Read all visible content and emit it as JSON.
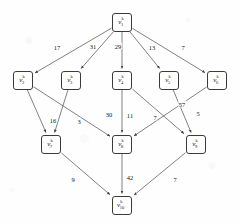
{
  "figure": {
    "background_color": "#fefefe",
    "node_stroke_color": "#3b3b3b",
    "edge_stroke_color": "#4a4a4a",
    "text_color": "#141414"
  },
  "graph": {
    "type": "directed-weighted-graph",
    "node_count": 10,
    "edge_count": 15,
    "layers": [
      [
        "v1"
      ],
      [
        "v2",
        "v3",
        "v4",
        "v5",
        "v6"
      ],
      [
        "v7",
        "v8",
        "v9"
      ],
      [
        "v10"
      ]
    ],
    "nodes": [
      {
        "id": "v1",
        "base": "v",
        "sup": "k",
        "sub": "1",
        "cx": 122,
        "cy": 22,
        "w": 20,
        "h": 19
      },
      {
        "id": "v2",
        "base": "v",
        "sup": "k",
        "sub": "2",
        "cx": 23,
        "cy": 80,
        "w": 20,
        "h": 19
      },
      {
        "id": "v3",
        "base": "v",
        "sup": "k",
        "sub": "3",
        "cx": 71,
        "cy": 80,
        "w": 20,
        "h": 19
      },
      {
        "id": "v4",
        "base": "v",
        "sup": "k",
        "sub": "4",
        "cx": 122,
        "cy": 80,
        "w": 20,
        "h": 19
      },
      {
        "id": "v5",
        "base": "v",
        "sup": "k",
        "sub": "5",
        "cx": 169,
        "cy": 80,
        "w": 20,
        "h": 19
      },
      {
        "id": "v6",
        "base": "v",
        "sup": "k",
        "sub": "6",
        "cx": 217,
        "cy": 80,
        "w": 20,
        "h": 19
      },
      {
        "id": "v7",
        "base": "v",
        "sup": "k",
        "sub": "7",
        "cx": 51,
        "cy": 144,
        "w": 20,
        "h": 19
      },
      {
        "id": "v8",
        "base": "v",
        "sup": "k",
        "sub": "8",
        "cx": 122,
        "cy": 144,
        "w": 20,
        "h": 19
      },
      {
        "id": "v9",
        "base": "v",
        "sup": "k",
        "sub": "9",
        "cx": 196,
        "cy": 144,
        "w": 20,
        "h": 19
      },
      {
        "id": "v10",
        "base": "v",
        "sup": "k",
        "sub": "10",
        "cx": 122,
        "cy": 205,
        "w": 20,
        "h": 19
      }
    ],
    "edges": [
      {
        "from": "v1",
        "to": "v2",
        "weight": "17",
        "lx": 57,
        "ly": 47
      },
      {
        "from": "v1",
        "to": "v3",
        "weight": "31",
        "lx": 93,
        "ly": 46
      },
      {
        "from": "v1",
        "to": "v4",
        "weight": "29",
        "lx": 118,
        "ly": 46
      },
      {
        "from": "v1",
        "to": "v5",
        "weight": "13",
        "lx": 152,
        "ly": 47
      },
      {
        "from": "v1",
        "to": "v6",
        "weight": "7",
        "lx": 183,
        "ly": 47
      },
      {
        "from": "v2",
        "to": "v7",
        "weight": "16",
        "lx": 53,
        "ly": 120
      },
      {
        "from": "v3",
        "to": "v7",
        "weight": "3",
        "lx": 79,
        "ly": 121
      },
      {
        "from": "v2",
        "to": "v8",
        "weight": "30",
        "lx": 109,
        "ly": 114
      },
      {
        "from": "v4",
        "to": "v8",
        "weight": "11",
        "lx": 130,
        "ly": 115
      },
      {
        "from": "v4",
        "to": "v9",
        "weight": "7",
        "lx": 155,
        "ly": 117
      },
      {
        "from": "v5",
        "to": "v9",
        "weight": "57",
        "lx": 182,
        "ly": 104
      },
      {
        "from": "v6",
        "to": "v8",
        "weight": "5",
        "lx": 198,
        "ly": 113
      },
      {
        "from": "v7",
        "to": "v10",
        "weight": "9",
        "lx": 73,
        "ly": 179
      },
      {
        "from": "v8",
        "to": "v10",
        "weight": "42",
        "lx": 130,
        "ly": 177
      },
      {
        "from": "v9",
        "to": "v10",
        "weight": "7",
        "lx": 175,
        "ly": 179
      }
    ]
  }
}
